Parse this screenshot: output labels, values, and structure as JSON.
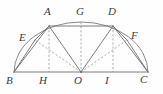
{
  "figure": {
    "background_color": "#fefefe",
    "stroke_color": "#6e6e70",
    "dash_color": "#9a9a9c"
  },
  "points": [
    {
      "id": "A",
      "label": "A",
      "x": 49.0,
      "y": 26.0,
      "label_x": 44.0,
      "label_y": 6.0
    },
    {
      "id": "G",
      "label": "G",
      "x": 81.0,
      "y": 22.0,
      "label_x": 76.0,
      "label_y": 6.0
    },
    {
      "id": "D",
      "label": "D",
      "x": 113.0,
      "y": 26.0,
      "label_x": 108.0,
      "label_y": 6.0
    },
    {
      "id": "E",
      "label": "E",
      "x": 35.0,
      "y": 40.0,
      "label_x": 19.0,
      "label_y": 32.0
    },
    {
      "id": "F",
      "label": "F",
      "x": 127.0,
      "y": 40.0,
      "label_x": 131.0,
      "label_y": 30.0
    },
    {
      "id": "B",
      "label": "B",
      "x": 14.0,
      "y": 72.0,
      "label_x": 6.0,
      "label_y": 75.0
    },
    {
      "id": "H",
      "label": "H",
      "x": 49.0,
      "y": 72.0,
      "label_x": 39.0,
      "label_y": 75.0
    },
    {
      "id": "O",
      "label": "O",
      "x": 81.0,
      "y": 72.0,
      "label_x": 74.0,
      "label_y": 75.0
    },
    {
      "id": "I",
      "label": "I",
      "x": 113.0,
      "y": 72.0,
      "label_x": 105.0,
      "label_y": 75.0
    },
    {
      "id": "C",
      "label": "C",
      "x": 148.0,
      "y": 72.0,
      "label_x": 140.0,
      "label_y": 74.0
    }
  ],
  "solid_segments": [
    {
      "name": "segment-BC",
      "from": "B",
      "to": "C"
    },
    {
      "name": "segment-BE",
      "from": "B",
      "to": "E"
    },
    {
      "name": "segment-EA",
      "from": "E",
      "to": "A"
    },
    {
      "name": "segment-AD",
      "from": "A",
      "to": "D"
    },
    {
      "name": "segment-DF",
      "from": "D",
      "to": "F"
    },
    {
      "name": "segment-FC",
      "from": "F",
      "to": "C"
    },
    {
      "name": "segment-AB",
      "from": "A",
      "to": "B"
    },
    {
      "name": "segment-DC",
      "from": "D",
      "to": "C"
    },
    {
      "name": "segment-AO",
      "from": "A",
      "to": "O"
    },
    {
      "name": "segment-DO",
      "from": "D",
      "to": "O"
    }
  ],
  "dashed_segments": [
    {
      "name": "perpendicular-AH",
      "from": "A",
      "to": "H"
    },
    {
      "name": "perpendicular-DI",
      "from": "D",
      "to": "I"
    },
    {
      "name": "axis-GO",
      "from": "G",
      "to": "O"
    },
    {
      "name": "radius-OE",
      "from": "O",
      "to": "E"
    },
    {
      "name": "radius-OF",
      "from": "O",
      "to": "F"
    }
  ],
  "arc": {
    "name": "semicircle-arc-BC",
    "center_x": 81.0,
    "center_y": 72.0,
    "radius_x": 67.0,
    "radius_y": 50.0,
    "start_x": 14.0,
    "start_y": 72.0,
    "end_x": 148.0,
    "end_y": 72.0
  }
}
